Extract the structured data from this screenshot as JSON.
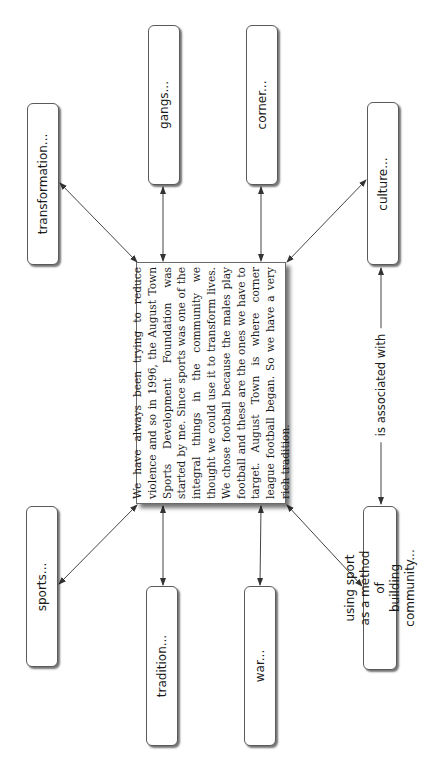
{
  "diagram": {
    "orientation": "rotated 90 degrees counter-clockwise",
    "central_quote": {
      "text": "We have always been trying to reduce violence and so in 1996, the August Town Sports Development Foundation was started by me. Since sports was one of the integral things in the community we thought we could use it to transform lives. We chose football because the males play football and these are the ones we have to target. August Town is where corner league football began. So we have a very rich tradition."
    },
    "nodes": [
      {
        "id": "transformation",
        "label": "transformation..."
      },
      {
        "id": "gangs",
        "label": "gangs..."
      },
      {
        "id": "corner",
        "label": "corner..."
      },
      {
        "id": "culture",
        "label": "culture..."
      },
      {
        "id": "sports",
        "label": "sports..."
      },
      {
        "id": "tradition",
        "label": "tradition..."
      },
      {
        "id": "war",
        "label": "war..."
      },
      {
        "id": "using-sport",
        "label": "using sport as a method of\nbuilding community..."
      }
    ],
    "edges": [
      {
        "from": "central_quote",
        "to": "transformation",
        "type": "bidirectional"
      },
      {
        "from": "central_quote",
        "to": "gangs",
        "type": "bidirectional"
      },
      {
        "from": "central_quote",
        "to": "corner",
        "type": "bidirectional"
      },
      {
        "from": "central_quote",
        "to": "culture",
        "type": "bidirectional"
      },
      {
        "from": "central_quote",
        "to": "sports",
        "type": "bidirectional"
      },
      {
        "from": "central_quote",
        "to": "tradition",
        "type": "bidirectional"
      },
      {
        "from": "central_quote",
        "to": "war",
        "type": "bidirectional"
      },
      {
        "from": "central_quote",
        "to": "using-sport",
        "type": "bidirectional"
      },
      {
        "from": "culture",
        "to": "using-sport",
        "type": "bidirectional",
        "label": "is associated with"
      }
    ],
    "colors": {
      "line": "#444444",
      "border": "#5a5a5a",
      "text": "#1a1a1a",
      "background": "#ffffff"
    }
  }
}
